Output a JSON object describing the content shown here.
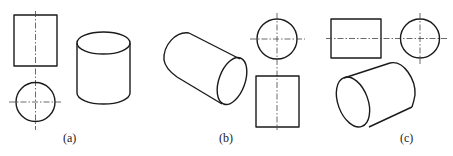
{
  "figure": {
    "line_color": "#1a1a1a",
    "centerline_color": "#444444",
    "panels": [
      {
        "id": "a",
        "label": "(a)",
        "orthographic_views": [
          "rectangle (front view)",
          "circle with centerlines (top view)"
        ],
        "pictorial": "upright cylinder"
      },
      {
        "id": "b",
        "label": "(b)",
        "orthographic_views": [
          "circle with centerlines",
          "rectangle with vertical centerline"
        ],
        "pictorial": "cylinder lying slanted, axis toward lower right"
      },
      {
        "id": "c",
        "label": "(c)",
        "orthographic_views": [
          "rectangle with horizontal centerline",
          "circle with centerlines"
        ],
        "pictorial": "cylinder lying slanted, axis toward upper right"
      }
    ]
  }
}
